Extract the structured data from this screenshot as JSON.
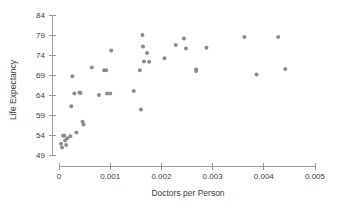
{
  "chart_data": {
    "type": "scatter",
    "title": "",
    "xlabel": "Doctors per Person",
    "ylabel": "Life Expectancy",
    "xlim": [
      0,
      0.005
    ],
    "ylim": [
      49,
      84
    ],
    "xticks": [
      "0",
      "0.001",
      "0.002",
      "0.003",
      "0.004",
      "0.005"
    ],
    "xtick_values": [
      0,
      0.001,
      0.002,
      0.003,
      0.004,
      0.005
    ],
    "yticks": [
      "49",
      "54",
      "59",
      "64",
      "69",
      "74",
      "79",
      "84"
    ],
    "ytick_values": [
      49,
      54,
      59,
      64,
      69,
      74,
      79,
      84
    ],
    "grid": false,
    "legend": null,
    "marker_color": "#8c8c8c",
    "marker_size": 4,
    "points": [
      {
        "x": 4e-05,
        "y": 51.8
      },
      {
        "x": 6e-05,
        "y": 50.9
      },
      {
        "x": 8e-05,
        "y": 53.8
      },
      {
        "x": 0.0001,
        "y": 53.9
      },
      {
        "x": 0.00012,
        "y": 52.6
      },
      {
        "x": 0.00014,
        "y": 51.5
      },
      {
        "x": 0.00016,
        "y": 53.2
      },
      {
        "x": 0.00022,
        "y": 53.7
      },
      {
        "x": 0.00024,
        "y": 61.2
      },
      {
        "x": 0.00026,
        "y": 68.7
      },
      {
        "x": 0.0003,
        "y": 64.4
      },
      {
        "x": 0.00034,
        "y": 54.6
      },
      {
        "x": 0.0004,
        "y": 64.6
      },
      {
        "x": 0.00042,
        "y": 64.5
      },
      {
        "x": 0.00046,
        "y": 57.3
      },
      {
        "x": 0.00048,
        "y": 56.6
      },
      {
        "x": 0.00064,
        "y": 70.9
      },
      {
        "x": 0.00078,
        "y": 64.0
      },
      {
        "x": 0.00088,
        "y": 70.2
      },
      {
        "x": 0.00092,
        "y": 70.2
      },
      {
        "x": 0.00094,
        "y": 64.4
      },
      {
        "x": 0.001,
        "y": 64.4
      },
      {
        "x": 0.00102,
        "y": 75.1
      },
      {
        "x": 0.00146,
        "y": 65.0
      },
      {
        "x": 0.00158,
        "y": 70.2
      },
      {
        "x": 0.0016,
        "y": 60.4
      },
      {
        "x": 0.00163,
        "y": 79.0
      },
      {
        "x": 0.00164,
        "y": 76.1
      },
      {
        "x": 0.00166,
        "y": 72.4
      },
      {
        "x": 0.00172,
        "y": 74.5
      },
      {
        "x": 0.00176,
        "y": 72.3
      },
      {
        "x": 0.00206,
        "y": 73.2
      },
      {
        "x": 0.00228,
        "y": 76.5
      },
      {
        "x": 0.00244,
        "y": 78.1
      },
      {
        "x": 0.00248,
        "y": 75.6
      },
      {
        "x": 0.00268,
        "y": 70.4
      },
      {
        "x": 0.00268,
        "y": 70.0
      },
      {
        "x": 0.00288,
        "y": 75.8
      },
      {
        "x": 0.00362,
        "y": 78.5
      },
      {
        "x": 0.00386,
        "y": 69.1
      },
      {
        "x": 0.00428,
        "y": 78.5
      },
      {
        "x": 0.00442,
        "y": 70.5
      }
    ]
  }
}
